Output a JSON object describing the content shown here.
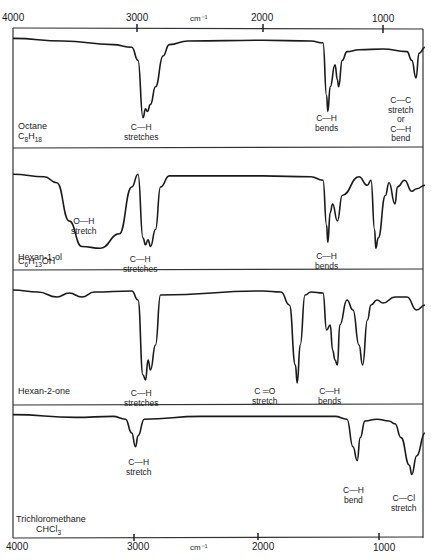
{
  "chart_data": {
    "type": "line",
    "title": "",
    "xlabel": "cm⁻¹",
    "ylabel": "",
    "x_axis": {
      "reversed": true,
      "range": [
        4000,
        650
      ],
      "ticks": [
        4000,
        3000,
        2000,
        1000
      ],
      "tick_labels": [
        "4000",
        "3000",
        "2000",
        "1000"
      ],
      "unit_label": "cm⁻¹"
    },
    "grid": false,
    "panels": [
      {
        "name": "Octane",
        "formula": "C₈H₁₈",
        "annotations": [
          {
            "text": "C—H\nstretches",
            "x": 2930
          },
          {
            "text": "C—H\nbends",
            "x": 1460
          },
          {
            "text": "C—C\nstretch\nor\nC—H\nbend",
            "x": 725
          }
        ],
        "trace": [
          [
            4000,
            95
          ],
          [
            3600,
            92
          ],
          [
            3200,
            88
          ],
          [
            3050,
            85
          ],
          [
            3000,
            70
          ],
          [
            2960,
            5
          ],
          [
            2940,
            15
          ],
          [
            2925,
            12
          ],
          [
            2900,
            20
          ],
          [
            2860,
            40
          ],
          [
            2800,
            75
          ],
          [
            2750,
            88
          ],
          [
            2600,
            92
          ],
          [
            2000,
            93
          ],
          [
            1600,
            92
          ],
          [
            1500,
            90
          ],
          [
            1470,
            30
          ],
          [
            1460,
            12
          ],
          [
            1440,
            40
          ],
          [
            1400,
            65
          ],
          [
            1380,
            48
          ],
          [
            1370,
            40
          ],
          [
            1340,
            70
          ],
          [
            1300,
            80
          ],
          [
            1200,
            82
          ],
          [
            1000,
            83
          ],
          [
            800,
            80
          ],
          [
            760,
            70
          ],
          [
            725,
            50
          ],
          [
            700,
            78
          ],
          [
            650,
            85
          ]
        ]
      },
      {
        "name": "Hexan-1-ol",
        "formula": "C₆H₁₃OH",
        "annotations": [
          {
            "text": "O—H\nstretch",
            "x": 3330
          },
          {
            "text": "C—H\nstretches",
            "x": 2930
          },
          {
            "text": "C—H\nbends",
            "x": 1460
          }
        ],
        "trace": [
          [
            4000,
            95
          ],
          [
            3750,
            92
          ],
          [
            3650,
            85
          ],
          [
            3550,
            40
          ],
          [
            3450,
            10
          ],
          [
            3300,
            8
          ],
          [
            3150,
            25
          ],
          [
            3050,
            80
          ],
          [
            3000,
            95
          ],
          [
            2960,
            20
          ],
          [
            2940,
            12
          ],
          [
            2920,
            18
          ],
          [
            2900,
            10
          ],
          [
            2860,
            30
          ],
          [
            2820,
            80
          ],
          [
            2750,
            93
          ],
          [
            2000,
            93
          ],
          [
            1600,
            92
          ],
          [
            1500,
            88
          ],
          [
            1470,
            35
          ],
          [
            1460,
            15
          ],
          [
            1440,
            50
          ],
          [
            1420,
            60
          ],
          [
            1380,
            40
          ],
          [
            1340,
            70
          ],
          [
            1200,
            92
          ],
          [
            1130,
            82
          ],
          [
            1100,
            88
          ],
          [
            1070,
            30
          ],
          [
            1060,
            8
          ],
          [
            1040,
            20
          ],
          [
            980,
            70
          ],
          [
            950,
            85
          ],
          [
            900,
            60
          ],
          [
            880,
            80
          ],
          [
            820,
            88
          ],
          [
            760,
            75
          ],
          [
            720,
            78
          ],
          [
            650,
            82
          ]
        ]
      },
      {
        "name": "Hexan-2-one",
        "formula": "",
        "annotations": [
          {
            "text": "C—H\nstretches",
            "x": 2930
          },
          {
            "text": "C ═O\nstretch",
            "x": 1715
          },
          {
            "text": "C—H\nbends",
            "x": 1400
          }
        ],
        "trace": [
          [
            4000,
            95
          ],
          [
            3800,
            93
          ],
          [
            3650,
            88
          ],
          [
            3550,
            92
          ],
          [
            3450,
            88
          ],
          [
            3350,
            93
          ],
          [
            3050,
            94
          ],
          [
            3000,
            85
          ],
          [
            2960,
            10
          ],
          [
            2940,
            5
          ],
          [
            2920,
            25
          ],
          [
            2900,
            15
          ],
          [
            2860,
            40
          ],
          [
            2820,
            90
          ],
          [
            2000,
            94
          ],
          [
            1850,
            93
          ],
          [
            1780,
            80
          ],
          [
            1730,
            20
          ],
          [
            1715,
            2
          ],
          [
            1690,
            40
          ],
          [
            1650,
            90
          ],
          [
            1600,
            93
          ],
          [
            1500,
            92
          ],
          [
            1470,
            55
          ],
          [
            1440,
            60
          ],
          [
            1420,
            35
          ],
          [
            1400,
            25
          ],
          [
            1380,
            20
          ],
          [
            1360,
            60
          ],
          [
            1300,
            85
          ],
          [
            1250,
            75
          ],
          [
            1200,
            40
          ],
          [
            1170,
            20
          ],
          [
            1130,
            65
          ],
          [
            1100,
            80
          ],
          [
            1050,
            85
          ],
          [
            1000,
            82
          ],
          [
            900,
            88
          ],
          [
            800,
            88
          ],
          [
            720,
            75
          ],
          [
            650,
            80
          ]
        ]
      },
      {
        "name": "Trichloromethane",
        "formula": "CHCl₃",
        "annotations": [
          {
            "text": "C—H\nstretch",
            "x": 3020
          },
          {
            "text": "C—H\nbend",
            "x": 1215
          },
          {
            "text": "C—Cl\nstretch",
            "x": 760
          }
        ],
        "trace": [
          [
            4000,
            95
          ],
          [
            3500,
            92
          ],
          [
            3200,
            93
          ],
          [
            3100,
            90
          ],
          [
            3050,
            75
          ],
          [
            3020,
            60
          ],
          [
            3000,
            72
          ],
          [
            2950,
            90
          ],
          [
            2500,
            93
          ],
          [
            2000,
            93
          ],
          [
            1400,
            93
          ],
          [
            1300,
            90
          ],
          [
            1250,
            60
          ],
          [
            1215,
            45
          ],
          [
            1190,
            70
          ],
          [
            1150,
            88
          ],
          [
            1050,
            90
          ],
          [
            950,
            88
          ],
          [
            900,
            85
          ],
          [
            850,
            70
          ],
          [
            780,
            40
          ],
          [
            760,
            30
          ],
          [
            720,
            50
          ],
          [
            650,
            75
          ]
        ]
      }
    ]
  },
  "axis": {
    "top_ticks": [
      "4000",
      "3000",
      "2000",
      "1000"
    ],
    "bottom_ticks": [
      "4000",
      "3000",
      "2000",
      "1000"
    ],
    "unit": "cm⁻¹"
  },
  "panels": [
    {
      "name": "Octane",
      "formula_html": "C<sub>8</sub>H<sub>18</sub>"
    },
    {
      "name": "Hexan-1-ol",
      "formula_html": "C<sub>6</sub>H<sub>13</sub>OH"
    },
    {
      "name": "Hexan-2-one",
      "formula_html": ""
    },
    {
      "name": "Trichloromethane",
      "formula_html": "CHCl<sub>3</sub>"
    }
  ],
  "annotations": {
    "p0": [
      "C—H\nstretches",
      "C—H\nbends",
      "C—C\nstretch\nor\nC—H\nbend"
    ],
    "p1": [
      "O—H\nstretch",
      "C—H\nstretches",
      "C—H\nbends"
    ],
    "p2": [
      "C—H\nstretches",
      "C ═O\nstretch",
      "C—H\nbends"
    ],
    "p3": [
      "C—H\nstretch",
      "C—H\nbend",
      "C—Cl\nstretch"
    ]
  },
  "colors": {
    "line": "#1a1a1a",
    "frame": "#333333",
    "background": "#ffffff"
  }
}
